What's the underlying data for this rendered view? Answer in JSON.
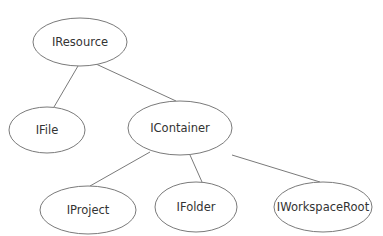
{
  "diagram": {
    "type": "tree",
    "title": "",
    "nodes": [
      {
        "id": "iresource",
        "label": "IResource",
        "cx": 80,
        "cy": 42,
        "rx": 47,
        "ry": 24
      },
      {
        "id": "ifile",
        "label": "IFile",
        "cx": 47,
        "cy": 130,
        "rx": 38,
        "ry": 23
      },
      {
        "id": "icontainer",
        "label": "IContainer",
        "cx": 180,
        "cy": 128,
        "rx": 52,
        "ry": 27
      },
      {
        "id": "iproject",
        "label": "IProject",
        "cx": 88,
        "cy": 210,
        "rx": 48,
        "ry": 24
      },
      {
        "id": "ifolder",
        "label": "IFolder",
        "cx": 196,
        "cy": 207,
        "rx": 41,
        "ry": 25
      },
      {
        "id": "iworkspaceroot",
        "label": "IWorkspaceRoot",
        "cx": 323,
        "cy": 207,
        "rx": 49,
        "ry": 25
      }
    ],
    "edges": [
      {
        "from": "iresource",
        "to": "ifile",
        "x1": 78,
        "y1": 66,
        "x2": 54,
        "y2": 107
      },
      {
        "from": "iresource",
        "to": "icontainer",
        "x1": 96,
        "y1": 64,
        "x2": 176,
        "y2": 101
      },
      {
        "from": "icontainer",
        "to": "iproject",
        "x1": 150,
        "y1": 152,
        "x2": 90,
        "y2": 186
      },
      {
        "from": "icontainer",
        "to": "ifolder",
        "x1": 190,
        "y1": 155,
        "x2": 202,
        "y2": 182
      },
      {
        "from": "icontainer",
        "to": "iworkspaceroot",
        "x1": 232,
        "y1": 155,
        "x2": 320,
        "y2": 182
      }
    ],
    "colors": {
      "stroke": "#7a7a7a",
      "text": "#333333",
      "background": "#ffffff"
    }
  }
}
